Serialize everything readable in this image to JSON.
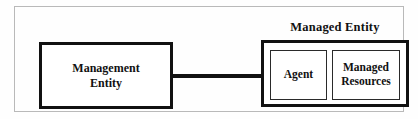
{
  "diagram": {
    "title": "Managed Entity",
    "nodes": {
      "management_entity": {
        "label": "Management\nEntity"
      },
      "managed_entity_group": {
        "label": "Managed Entity"
      },
      "agent": {
        "label": "Agent"
      },
      "managed_resources": {
        "label": "Managed\nResources"
      }
    },
    "connector": {
      "from": "management_entity",
      "to": "agent",
      "style": "solid-line"
    },
    "colors": {
      "stroke": "#111111",
      "frame": "#b9b9b9",
      "background": "#fefefe",
      "box_fill": "#ffffff"
    }
  }
}
